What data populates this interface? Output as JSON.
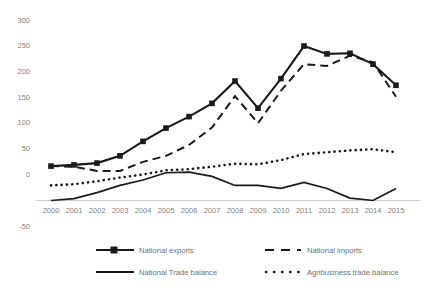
{
  "chart_data": {
    "type": "line",
    "title": "",
    "xlabel": "",
    "ylabel": "",
    "grid": false,
    "legend_position": "bottom",
    "x": [
      2000,
      2001,
      2002,
      2003,
      2004,
      2005,
      2006,
      2007,
      2008,
      2009,
      2010,
      2011,
      2012,
      2013,
      2014,
      2015
    ],
    "categories": [
      "2000",
      "2001",
      "2002",
      "2003",
      "2004",
      "2005",
      "2006",
      "2007",
      "2008",
      "2009",
      "2010",
      "2011",
      "2012",
      "2013",
      "2014",
      "2015"
    ],
    "ylim": [
      -50,
      300
    ],
    "yticks": [
      300,
      250,
      200,
      150,
      100,
      50,
      0,
      -50
    ],
    "ytick_labels": [
      "300",
      "250",
      "200",
      "150",
      "100",
      "50",
      "0",
      "-50"
    ],
    "series": [
      {
        "name": "National exports",
        "style": "solid-marker",
        "marker": "square",
        "values": [
          57,
          59,
          62,
          74,
          98,
          120,
          139,
          161,
          198,
          153,
          202,
          256,
          243,
          244,
          226,
          191
        ]
      },
      {
        "name": "National imports",
        "style": "dashed",
        "marker": "none",
        "values": [
          57,
          56,
          49,
          49,
          64,
          74,
          92,
          121,
          173,
          128,
          182,
          226,
          223,
          240,
          229,
          172
        ]
      },
      {
        "name": "National Trade balance",
        "style": "solid-thin",
        "marker": "none",
        "values": [
          0,
          3,
          13,
          25,
          34,
          46,
          47,
          40,
          25,
          25,
          20,
          30,
          20,
          4,
          0,
          20
        ]
      },
      {
        "name": "Agribusiness trade balance",
        "style": "dotted",
        "marker": "none",
        "values": [
          25,
          27,
          32,
          38,
          43,
          50,
          52,
          56,
          61,
          60,
          67,
          77,
          80,
          83,
          85,
          80
        ]
      }
    ]
  },
  "axes": {
    "y_labels": [
      "300",
      "250",
      "200",
      "150",
      "100",
      "50",
      "0",
      "-50"
    ],
    "x_labels": [
      "2000",
      "2001",
      "2002",
      "2003",
      "2004",
      "2005",
      "2006",
      "2007",
      "2008",
      "2009",
      "2010",
      "2011",
      "2012",
      "2013",
      "2014",
      "2015"
    ]
  },
  "legend": {
    "items": [
      {
        "label": "National exports",
        "style": "solid-marker"
      },
      {
        "label": "National imports",
        "style": "dashed"
      },
      {
        "label": "National Trade balance",
        "style": "solid-thin"
      },
      {
        "label": "Agribusiness trade balance",
        "style": "dotted"
      }
    ]
  },
  "colors": {
    "series": "#1a1a1a",
    "axis_text": "#808080",
    "legend_text": "#6f6f6f",
    "axis_line": "#d0d0d0",
    "background": "#ffffff"
  }
}
